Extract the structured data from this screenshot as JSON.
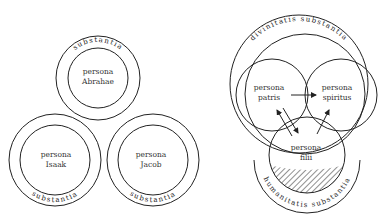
{
  "left_diagram": {
    "persons": [
      {
        "line1": "persona",
        "line2": "Abrahae",
        "ring_label": "substantia"
      },
      {
        "line1": "persona",
        "line2": "Isaak",
        "ring_label": "substantia"
      },
      {
        "line1": "persona",
        "line2": "Jacob",
        "ring_label": "substantia"
      }
    ]
  },
  "right_diagram": {
    "outer_ring_label": "divinitatis substantia",
    "lower_ring_label": "humanitatis substantia",
    "persons": [
      {
        "line1": "persona",
        "line2": "patris"
      },
      {
        "line1": "persona",
        "line2": "spiritus"
      },
      {
        "line1": "persona",
        "line2": "filii"
      }
    ],
    "arrows": [
      "patris-to-spiritus",
      "patris-to-filii",
      "filii-to-patris",
      "filii-to-spiritus"
    ]
  }
}
